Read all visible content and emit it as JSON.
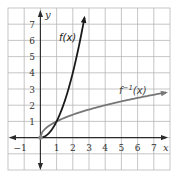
{
  "chart_data": {
    "type": "line",
    "title": "",
    "xlabel": "x",
    "ylabel": "y",
    "xlim": [
      -2,
      8
    ],
    "ylim": [
      -2,
      8
    ],
    "grid": true,
    "x_tick_labels": [
      "−1",
      "1",
      "2",
      "3",
      "4",
      "5",
      "6",
      "7"
    ],
    "x_ticks": [
      -1,
      1,
      2,
      3,
      4,
      5,
      6,
      7
    ],
    "y_tick_labels": [
      "1",
      "2",
      "3",
      "4",
      "5",
      "6",
      "7"
    ],
    "y_ticks": [
      1,
      2,
      3,
      4,
      5,
      6,
      7
    ],
    "series": [
      {
        "name": "f(x)",
        "label": "f(x)",
        "expression": "x^2, x >= 0",
        "color": "#1a1a1a",
        "x": [
          0,
          0.5,
          1,
          1.5,
          2,
          2.5,
          2.7
        ],
        "y": [
          0,
          0.25,
          1,
          2.25,
          4,
          6.25,
          7.3
        ]
      },
      {
        "name": "f^-1(x)",
        "label_base": "f",
        "label_sup": "−1",
        "label_tail": "(x)",
        "expression": "sqrt(x), x >= 0",
        "color": "#777777",
        "x": [
          0,
          0.25,
          1,
          2,
          3,
          4,
          5,
          6,
          7,
          7.8
        ],
        "y": [
          0,
          0.5,
          1,
          1.41,
          1.73,
          2,
          2.24,
          2.45,
          2.65,
          2.79
        ]
      }
    ],
    "annotations": [
      {
        "text": "f(x)",
        "x": 1.6,
        "y": 6
      },
      {
        "text": "f^-1(x)",
        "x": 5,
        "y": 3.2
      }
    ],
    "legend_position": "none"
  },
  "labels": {
    "x_axis": "x",
    "y_axis": "y",
    "f_label": "f(x)",
    "finv_base": "f",
    "finv_sup": "−1",
    "finv_tail": "(x)"
  }
}
